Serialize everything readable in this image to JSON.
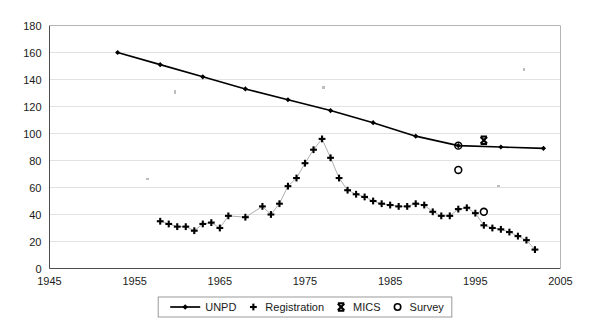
{
  "chart_data": {
    "type": "scatter",
    "title": "",
    "subtitle": "",
    "xlabel": "",
    "ylabel": "",
    "xlim": [
      1945,
      2005
    ],
    "ylim": [
      0,
      180
    ],
    "x_ticks": [
      1945,
      1955,
      1965,
      1975,
      1985,
      1995,
      2005
    ],
    "y_ticks": [
      0,
      20,
      40,
      60,
      80,
      100,
      120,
      140,
      160,
      180
    ],
    "grid": true,
    "legend_position": "bottom",
    "legend": [
      "UNPD",
      "Registration",
      "MICS",
      "Survey"
    ],
    "series": [
      {
        "name": "UNPD",
        "marker": "diamond",
        "line": true,
        "color": "#000000",
        "points": [
          {
            "x": 1953,
            "y": 160
          },
          {
            "x": 1958,
            "y": 151
          },
          {
            "x": 1963,
            "y": 142
          },
          {
            "x": 1968,
            "y": 133
          },
          {
            "x": 1973,
            "y": 125
          },
          {
            "x": 1978,
            "y": 117
          },
          {
            "x": 1983,
            "y": 108
          },
          {
            "x": 1988,
            "y": 98
          },
          {
            "x": 1993,
            "y": 91
          },
          {
            "x": 1998,
            "y": 90
          },
          {
            "x": 2003,
            "y": 89
          }
        ]
      },
      {
        "name": "Registration",
        "marker": "plus",
        "line": true,
        "color": "#000000",
        "points": [
          {
            "x": 1958,
            "y": 35
          },
          {
            "x": 1959,
            "y": 33
          },
          {
            "x": 1960,
            "y": 31
          },
          {
            "x": 1961,
            "y": 31
          },
          {
            "x": 1962,
            "y": 28
          },
          {
            "x": 1963,
            "y": 33
          },
          {
            "x": 1964,
            "y": 34
          },
          {
            "x": 1965,
            "y": 30
          },
          {
            "x": 1966,
            "y": 39
          },
          {
            "x": 1968,
            "y": 38
          },
          {
            "x": 1970,
            "y": 46
          },
          {
            "x": 1971,
            "y": 40
          },
          {
            "x": 1972,
            "y": 48
          },
          {
            "x": 1973,
            "y": 61
          },
          {
            "x": 1974,
            "y": 67
          },
          {
            "x": 1975,
            "y": 78
          },
          {
            "x": 1976,
            "y": 88
          },
          {
            "x": 1977,
            "y": 96
          },
          {
            "x": 1978,
            "y": 82
          },
          {
            "x": 1979,
            "y": 67
          },
          {
            "x": 1980,
            "y": 58
          },
          {
            "x": 1981,
            "y": 55
          },
          {
            "x": 1982,
            "y": 53
          },
          {
            "x": 1983,
            "y": 50
          },
          {
            "x": 1984,
            "y": 48
          },
          {
            "x": 1985,
            "y": 47
          },
          {
            "x": 1986,
            "y": 46
          },
          {
            "x": 1987,
            "y": 46
          },
          {
            "x": 1988,
            "y": 48
          },
          {
            "x": 1989,
            "y": 47
          },
          {
            "x": 1990,
            "y": 42
          },
          {
            "x": 1991,
            "y": 39
          },
          {
            "x": 1992,
            "y": 39
          },
          {
            "x": 1993,
            "y": 44
          },
          {
            "x": 1994,
            "y": 45
          },
          {
            "x": 1995,
            "y": 41
          },
          {
            "x": 1996,
            "y": 32
          },
          {
            "x": 1997,
            "y": 30
          },
          {
            "x": 1998,
            "y": 29
          },
          {
            "x": 1999,
            "y": 27
          },
          {
            "x": 2000,
            "y": 24
          },
          {
            "x": 2001,
            "y": 21
          },
          {
            "x": 2002,
            "y": 14
          }
        ]
      },
      {
        "name": "MICS",
        "marker": "cross",
        "line": false,
        "color": "#000000",
        "points": [
          {
            "x": 1996,
            "y": 95
          }
        ]
      },
      {
        "name": "Survey",
        "marker": "circle",
        "line": false,
        "color": "#000000",
        "points": [
          {
            "x": 1993,
            "y": 91
          },
          {
            "x": 1993,
            "y": 73
          },
          {
            "x": 1996,
            "y": 42
          }
        ]
      }
    ]
  },
  "legend": {
    "items": [
      {
        "label": "UNPD",
        "marker": "line-diamond"
      },
      {
        "label": "Registration",
        "marker": "plus"
      },
      {
        "label": "MICS",
        "marker": "cross"
      },
      {
        "label": "Survey",
        "marker": "circle"
      }
    ]
  },
  "axes": {
    "y_tick_labels": [
      "180",
      "160",
      "140",
      "120",
      "100",
      "80",
      "60",
      "40",
      "20",
      "0"
    ],
    "x_tick_labels": [
      "1945",
      "1955",
      "1965",
      "1975",
      "1985",
      "1995",
      "2005"
    ]
  }
}
